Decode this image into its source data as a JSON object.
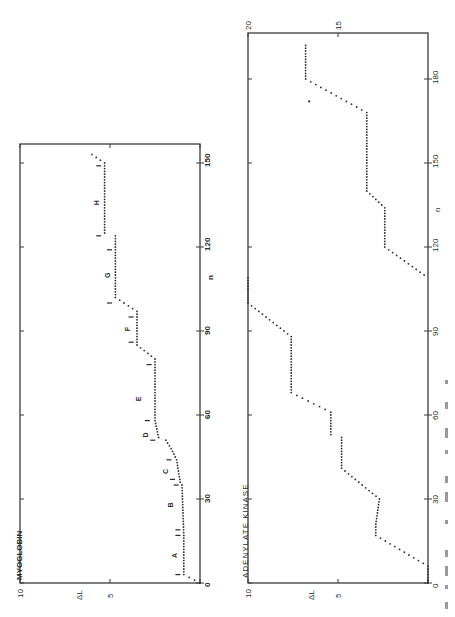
{
  "figure": {
    "orientation": "rotated-90-clockwise",
    "caption_visible": "illegible (cut off at right edge)"
  },
  "chart_data": [
    {
      "type": "line",
      "style": "dotted-step",
      "title": "MYOGLOBIN",
      "xlabel": "n",
      "ylabel": "ΔL",
      "xlim": [
        0,
        150
      ],
      "ylim": [
        0,
        10
      ],
      "xticks": [
        0,
        30,
        60,
        90,
        120,
        150
      ],
      "yticks": [
        0,
        5,
        10
      ],
      "grid": false,
      "x": [
        0,
        3,
        17,
        35,
        36,
        44,
        48,
        51,
        52,
        58,
        80,
        85,
        97,
        102,
        124,
        125,
        150,
        153
      ],
      "values": [
        0,
        0.9,
        0.9,
        1.0,
        1.1,
        1.3,
        1.6,
        1.9,
        2.3,
        2.5,
        2.5,
        3.5,
        3.5,
        4.7,
        4.7,
        5.3,
        5.3,
        6.0
      ],
      "segment_labels": [
        {
          "label": "A",
          "n": 10,
          "dl": 1.3
        },
        {
          "label": "B",
          "n": 28,
          "dl": 1.5
        },
        {
          "label": "C",
          "n": 40,
          "dl": 1.8
        },
        {
          "label": "D",
          "n": 53,
          "dl": 2.9
        },
        {
          "label": "E",
          "n": 66,
          "dl": 3.3
        },
        {
          "label": "F",
          "n": 91,
          "dl": 3.9
        },
        {
          "label": "G",
          "n": 110,
          "dl": 5.0
        },
        {
          "label": "H",
          "n": 136,
          "dl": 5.6
        }
      ],
      "boundary_markers": [
        {
          "n": 3,
          "dl": 1.2
        },
        {
          "n": 17,
          "dl": 1.2
        },
        {
          "n": 19,
          "dl": 1.2
        },
        {
          "n": 35,
          "dl": 1.3
        },
        {
          "n": 37,
          "dl": 1.5
        },
        {
          "n": 44,
          "dl": 1.7
        },
        {
          "n": 51,
          "dl": 2.6
        },
        {
          "n": 58,
          "dl": 2.9
        },
        {
          "n": 78,
          "dl": 2.8
        },
        {
          "n": 86,
          "dl": 3.8
        },
        {
          "n": 95,
          "dl": 3.8
        },
        {
          "n": 100,
          "dl": 5.0
        },
        {
          "n": 119,
          "dl": 5.0
        },
        {
          "n": 124,
          "dl": 5.6
        },
        {
          "n": 149,
          "dl": 5.6
        }
      ]
    },
    {
      "type": "line",
      "style": "dotted-step",
      "title": "ADENYLATE KINASE",
      "xlabel": "n",
      "ylabel": "ΔL",
      "xlim": [
        0,
        190
      ],
      "ylim": [
        0,
        20
      ],
      "ylim_note": "values above 10 wrap to upper scale (10–20)",
      "xticks": [
        0,
        30,
        60,
        90,
        120,
        150,
        180
      ],
      "yticks_lower": [
        0,
        5,
        10
      ],
      "yticks_upper": [
        15,
        20
      ],
      "grid": false,
      "x": [
        0,
        6,
        17,
        21,
        30,
        41,
        52,
        53,
        61,
        68,
        88,
        100,
        109,
        120,
        134,
        140,
        168,
        180,
        192
      ],
      "values": [
        0,
        0,
        2.9,
        2.9,
        2.7,
        4.8,
        4.8,
        5.4,
        5.4,
        7.6,
        7.6,
        10.0,
        10.0,
        12.4,
        12.4,
        13.4,
        13.4,
        16.8,
        16.8
      ],
      "outliers": [
        {
          "n": 172,
          "dl": 16.6
        }
      ]
    }
  ],
  "labels": {
    "myoglobin_title": "MYOGLOBIN",
    "ak_title": "ADENYLATE KINASE",
    "ylabel": "ΔL",
    "xlabel": "n"
  }
}
